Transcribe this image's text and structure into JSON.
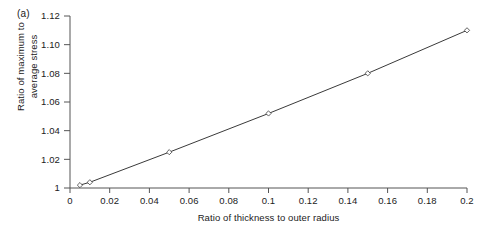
{
  "figure": {
    "panel_label": "(a)",
    "background_color": "#ffffff",
    "line_color": "#3a3a3a",
    "axis_color": "#555555",
    "text_color": "#222222"
  },
  "axis_titles": {
    "y_line1": "Ratio of maximum to",
    "y_line2": "average stress",
    "x": "Ratio of thickness to outer radius"
  },
  "chart_data": {
    "type": "line",
    "title": "",
    "subtitle": "",
    "annotations": [
      "(a)"
    ],
    "xlabel": "Ratio of thickness to outer radius",
    "ylabel": "Ratio of maximum to average stress",
    "xlim": [
      0,
      0.2
    ],
    "ylim": [
      1,
      1.12
    ],
    "xticks": [
      0,
      0.02,
      0.04,
      0.06,
      0.08,
      0.1,
      0.12,
      0.14,
      0.16,
      0.18,
      0.2
    ],
    "xticklabels": [
      "0",
      "0.02",
      "0.04",
      "0.06",
      "0.08",
      "0.1",
      "0.12",
      "0.14",
      "0.16",
      "0.18",
      "0.2"
    ],
    "yticks": [
      1,
      1.02,
      1.04,
      1.06,
      1.08,
      1.1,
      1.12
    ],
    "yticklabels": [
      "1",
      "1.02",
      "1.04",
      "1.06",
      "1.08",
      "1.10",
      "1.12"
    ],
    "grid": false,
    "legend": false,
    "legend_position": "none",
    "marker": "open-diamond",
    "series": [
      {
        "name": "Stress concentration",
        "x": [
          0.005,
          0.01,
          0.05,
          0.1,
          0.15,
          0.2
        ],
        "y": [
          1.002,
          1.004,
          1.025,
          1.052,
          1.08,
          1.11
        ]
      }
    ]
  }
}
